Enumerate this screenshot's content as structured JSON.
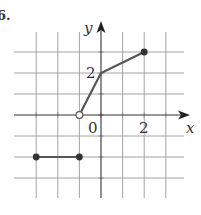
{
  "problem_label": "6.",
  "chart_data": {
    "type": "line",
    "title": "",
    "xlabel": "x",
    "ylabel": "y",
    "xlim": [
      -3,
      3
    ],
    "ylim": [
      -3,
      3
    ],
    "grid": true,
    "x_tick_labels": [
      {
        "value": 0,
        "label": "0"
      },
      {
        "value": 2,
        "label": "2"
      }
    ],
    "y_tick_labels": [
      {
        "value": 2,
        "label": "2"
      }
    ],
    "series": [
      {
        "name": "segment-1",
        "points": [
          {
            "x": -3,
            "y": -2,
            "marker": "closed"
          },
          {
            "x": -1,
            "y": -2,
            "marker": "closed"
          }
        ]
      },
      {
        "name": "segment-2",
        "points": [
          {
            "x": -1,
            "y": 0,
            "marker": "open"
          },
          {
            "x": 0,
            "y": 2,
            "marker": "none"
          },
          {
            "x": 2,
            "y": 3,
            "marker": "closed"
          }
        ]
      }
    ],
    "colors": {
      "line": "#555555",
      "grid": "#9a9a9a",
      "axis": "#333333"
    }
  }
}
